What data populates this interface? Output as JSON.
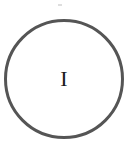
{
  "node": {
    "label": "I",
    "shape": "circle",
    "stroke_color": "#555555",
    "fill_color": "#ffffff"
  }
}
